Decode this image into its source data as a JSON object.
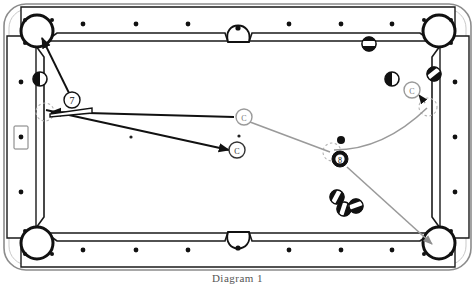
{
  "figure": {
    "caption": "Diagram 1"
  },
  "colors": {
    "cloth": "#ffffff",
    "rail_line": "#1a1a1a",
    "ball_dark": "#111111",
    "aim_line": "#111111",
    "path_line": "#9a9a9a",
    "ghost_outline": "#b0b0b0",
    "diamond": "#111111"
  },
  "table": {
    "outer_frame": "rounded-rectangle",
    "rails": {
      "top_diamonds": 6,
      "bottom_diamonds": 6,
      "left_diamonds": 3,
      "right_diamonds": 3,
      "boxed_diamond_side": "left-middle"
    },
    "pockets": [
      {
        "name": "top-left-corner",
        "x": 36,
        "y": 30
      },
      {
        "name": "top-side",
        "x": 238,
        "y": 22
      },
      {
        "name": "top-right-corner",
        "x": 440,
        "y": 30
      },
      {
        "name": "bottom-left-corner",
        "x": 36,
        "y": 250
      },
      {
        "name": "bottom-side",
        "x": 238,
        "y": 258
      },
      {
        "name": "bottom-right-corner",
        "x": 440,
        "y": 250
      }
    ]
  },
  "balls": [
    {
      "label": "",
      "kind": "half",
      "x": 40,
      "y": 79,
      "r": 7,
      "name": "ball-left-rail-half"
    },
    {
      "label": "7",
      "kind": "number",
      "x": 72,
      "y": 100,
      "r": 8,
      "name": "ball-7"
    },
    {
      "label": "",
      "kind": "stripe",
      "x": 369,
      "y": 44,
      "r": 7,
      "name": "ball-top-stripe"
    },
    {
      "label": "",
      "kind": "half",
      "x": 392,
      "y": 79,
      "r": 7,
      "name": "ball-right-half"
    },
    {
      "label": "",
      "kind": "stripe",
      "x": 434,
      "y": 74,
      "r": 7,
      "name": "ball-right-rail-stripe"
    },
    {
      "label": "",
      "kind": "small-dark",
      "x": 341,
      "y": 140,
      "r": 4,
      "name": "ball-small-dark"
    },
    {
      "label": "8",
      "kind": "number",
      "x": 340,
      "y": 159,
      "r": 8,
      "name": "ball-8"
    },
    {
      "label": "",
      "kind": "stripe",
      "x": 337,
      "y": 197,
      "r": 7,
      "name": "ball-cluster-a"
    },
    {
      "label": "",
      "kind": "stripe",
      "x": 344,
      "y": 209,
      "r": 7,
      "name": "ball-cluster-b"
    },
    {
      "label": "",
      "kind": "stripe",
      "x": 356,
      "y": 208,
      "r": 7,
      "name": "ball-cluster-c"
    }
  ],
  "cue_balls": [
    {
      "label": "C",
      "x": 244,
      "y": 117,
      "r": 8,
      "name": "cue-ball-position-1"
    },
    {
      "label": "C",
      "x": 237,
      "y": 150,
      "r": 8,
      "name": "cue-ball-position-2"
    },
    {
      "label": "C",
      "x": 412,
      "y": 90,
      "r": 8,
      "name": "cue-ball-position-3"
    }
  ],
  "ghost_balls": [
    {
      "x": 45,
      "y": 112,
      "r": 9,
      "name": "ghost-ball-left"
    },
    {
      "x": 332,
      "y": 152,
      "r": 9,
      "name": "ghost-ball-eight"
    },
    {
      "x": 428,
      "y": 107,
      "r": 9,
      "name": "ghost-ball-rail"
    }
  ],
  "spots": [
    {
      "x": 131,
      "y": 137,
      "name": "table-spot-left"
    },
    {
      "x": 239,
      "y": 136,
      "name": "table-spot-center"
    }
  ],
  "aim_lines": [
    {
      "name": "aim-seven-to-corner-pocket",
      "from": [
        72,
        100
      ],
      "to": [
        40,
        34
      ],
      "arrow": true
    },
    {
      "name": "aim-cue-to-left-ghost",
      "from": [
        232,
        117
      ],
      "to": [
        48,
        113
      ],
      "arrow": true
    },
    {
      "name": "aim-cue-travel-to-position-2",
      "from": [
        48,
        113
      ],
      "to": [
        232,
        150
      ],
      "arrow": true
    }
  ],
  "path_lines": [
    {
      "name": "path-cue-to-eight",
      "from": [
        244,
        124
      ],
      "to": [
        330,
        152
      ]
    },
    {
      "name": "path-eight-curve-to-rail",
      "from": [
        332,
        152
      ],
      "to": [
        428,
        107
      ]
    },
    {
      "name": "path-rail-to-cue-position-3",
      "from": [
        426,
        104
      ],
      "to": [
        418,
        95
      ],
      "arrow": true
    },
    {
      "name": "path-eight-to-bottom-right-pocket",
      "from": [
        346,
        166
      ],
      "to": [
        436,
        248
      ],
      "arrow": true
    }
  ],
  "cue_stick": {
    "name": "cue-stick",
    "tip": [
      52,
      114
    ],
    "butt": [
      92,
      110
    ]
  }
}
